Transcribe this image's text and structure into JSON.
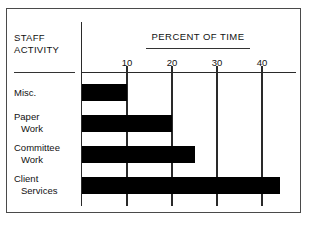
{
  "figure": {
    "category_header": "STAFF\nACTIVITY",
    "title": "PERCENT OF TIME"
  },
  "axis": {
    "ticks": [
      {
        "label": "10",
        "value": 10
      },
      {
        "label": "20",
        "value": 20
      },
      {
        "label": "30",
        "value": 30
      },
      {
        "label": "40",
        "value": 40
      }
    ]
  },
  "rows": [
    {
      "label_line1": "Misc.",
      "label_line2": "",
      "value": 10
    },
    {
      "label_line1": "Paper",
      "label_line2": "Work",
      "value": 20
    },
    {
      "label_line1": "Committee",
      "label_line2": "Work",
      "value": 25
    },
    {
      "label_line1": "Client",
      "label_line2": "Services",
      "value": 44
    }
  ],
  "colors": {
    "bar": "#000000",
    "axis": "#2a2a2a",
    "frame": "#4a4a4a",
    "text": "#111111",
    "background": "#ffffff"
  },
  "chart_data": {
    "type": "bar",
    "orientation": "horizontal",
    "title": "PERCENT OF TIME",
    "xlabel": "PERCENT OF TIME",
    "ylabel": "STAFF ACTIVITY",
    "categories": [
      "Misc.",
      "Paper Work",
      "Committee Work",
      "Client Services"
    ],
    "values": [
      10,
      20,
      25,
      44
    ],
    "series": [
      {
        "name": "Percent of time",
        "values": [
          10,
          20,
          25,
          44
        ]
      }
    ],
    "xlim": [
      0,
      48
    ],
    "xticks": [
      10,
      20,
      30,
      40
    ],
    "xticklabels": [
      "10",
      "20",
      "30",
      "40"
    ],
    "grid": true,
    "grid_axis": "x",
    "legend": false,
    "bar_color": "#000000"
  }
}
